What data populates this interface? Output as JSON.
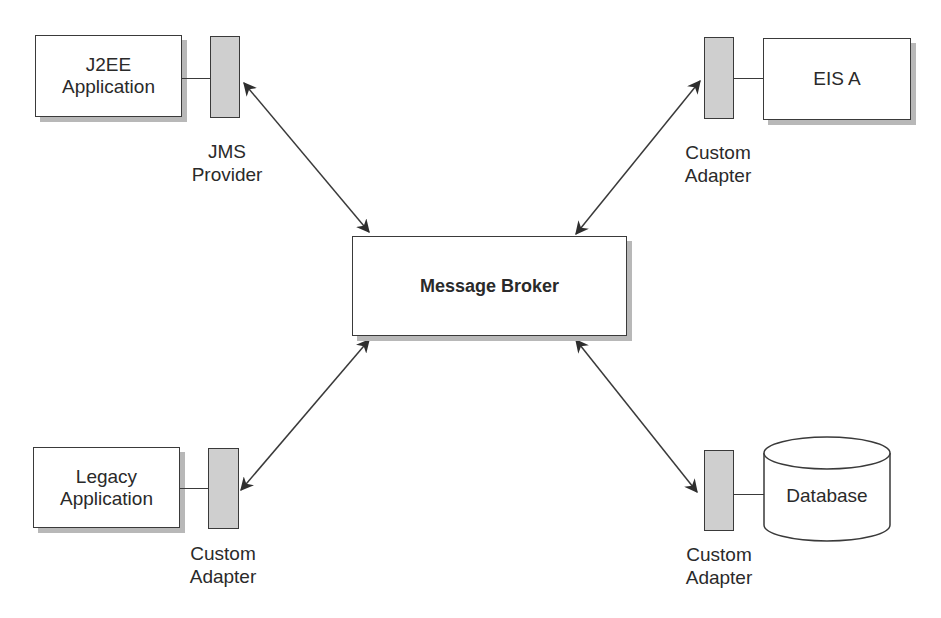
{
  "diagram": {
    "nodes": {
      "j2ee": {
        "line1": "J2EE",
        "line2": "Application"
      },
      "eis": {
        "label": "EIS A"
      },
      "broker": {
        "label": "Message Broker"
      },
      "legacy": {
        "line1": "Legacy",
        "line2": "Application"
      },
      "database": {
        "label": "Database"
      }
    },
    "adapters": {
      "jms": {
        "line1": "JMS",
        "line2": "Provider"
      },
      "eis_adapter": {
        "line1": "Custom",
        "line2": "Adapter"
      },
      "legacy_adapter": {
        "line1": "Custom",
        "line2": "Adapter"
      },
      "db_adapter": {
        "line1": "Custom",
        "line2": "Adapter"
      }
    },
    "edges": [
      {
        "from": "JMS Provider",
        "to": "Message Broker",
        "type": "bidirectional"
      },
      {
        "from": "Custom Adapter (EIS A)",
        "to": "Message Broker",
        "type": "bidirectional"
      },
      {
        "from": "Custom Adapter (Legacy Application)",
        "to": "Message Broker",
        "type": "bidirectional"
      },
      {
        "from": "Custom Adapter (Database)",
        "to": "Message Broker",
        "type": "bidirectional"
      }
    ],
    "colors": {
      "stroke": "#3a3a3a",
      "adapter_fill": "#cfcfcf",
      "shadow": "#b8b8b8"
    }
  }
}
